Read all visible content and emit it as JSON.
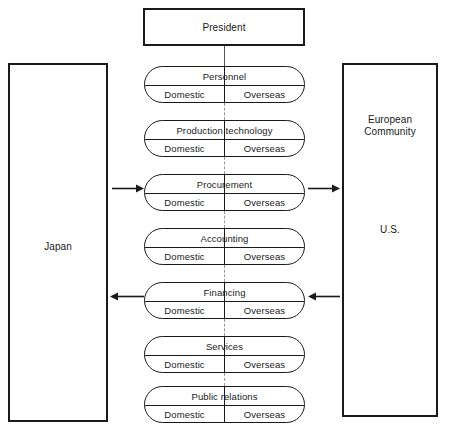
{
  "diagram": {
    "title": "President",
    "regions": {
      "left": {
        "label": "Japan"
      },
      "right": {
        "top_label": "European\nCommunity",
        "top_label_line1": "European",
        "top_label_line2": "Community",
        "bottom_label": "U.S."
      }
    },
    "sub_labels": {
      "domestic": "Domestic",
      "overseas": "Overseas"
    },
    "departments": [
      {
        "name": "Personnel",
        "domestic": "Domestic",
        "overseas": "Overseas",
        "top": 66
      },
      {
        "name": "Production technology",
        "domestic": "Domestic",
        "overseas": "Overseas",
        "top": 120
      },
      {
        "name": "Procurement",
        "domestic": "Domestic",
        "overseas": "Overseas",
        "top": 174
      },
      {
        "name": "Accounting",
        "domestic": "Domestic",
        "overseas": "Overseas",
        "top": 228
      },
      {
        "name": "Financing",
        "domestic": "Domestic",
        "overseas": "Overseas",
        "top": 282
      },
      {
        "name": "Services",
        "domestic": "Domestic",
        "overseas": "Overseas",
        "top": 336
      },
      {
        "name": "Public relations",
        "domestic": "Domestic",
        "overseas": "Overseas",
        "top": 386
      }
    ],
    "arrows": [
      {
        "name": "arrow-japan-to-procurement",
        "direction": "right",
        "left": 112,
        "top": 184,
        "width": 32
      },
      {
        "name": "arrow-procurement-to-european-community",
        "direction": "right",
        "left": 308,
        "top": 184,
        "width": 32
      },
      {
        "name": "arrow-financing-to-japan",
        "direction": "left",
        "left": 110,
        "top": 292,
        "width": 34
      },
      {
        "name": "arrow-us-to-financing",
        "direction": "left",
        "left": 308,
        "top": 292,
        "width": 32
      }
    ],
    "colors": {
      "stroke": "#1a1a1a",
      "dashed": "#9a9a9a",
      "background": "#ffffff"
    }
  }
}
